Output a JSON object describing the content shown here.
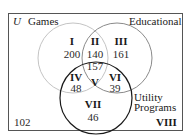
{
  "universe": {
    "label": "U",
    "outside_region": "VIII",
    "outside_count": "102"
  },
  "sets": {
    "games": {
      "label": "Games",
      "stroke": "#c4c4c4"
    },
    "educational": {
      "label": "Educational",
      "stroke": "#8a8a8a"
    },
    "utility": {
      "label_line1": "Utility",
      "label_line2": "Programs",
      "stroke": "#1a1a1a"
    }
  },
  "regions": [
    {
      "id": "I",
      "count": "200",
      "description": "Games only"
    },
    {
      "id": "II",
      "count": "140",
      "description": "Games and Educational only"
    },
    {
      "id": "III",
      "count": "161",
      "description": "Educational only"
    },
    {
      "id": "IV",
      "count": "48",
      "description": "Games and Utility only"
    },
    {
      "id": "V",
      "count": "157",
      "description": "All three"
    },
    {
      "id": "VI",
      "count": "39",
      "description": "Educational and Utility only"
    },
    {
      "id": "VII",
      "count": "46",
      "description": "Utility only"
    },
    {
      "id": "VIII",
      "count": "102",
      "description": "None"
    }
  ],
  "colors": {
    "box": "#555555",
    "text": "#222222"
  }
}
